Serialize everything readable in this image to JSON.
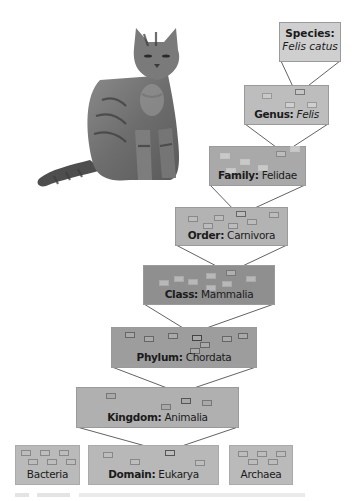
{
  "diagram": {
    "type": "taxonomic-hierarchy",
    "image": {
      "subject": "cat-photo",
      "description": "Grey tabby cat sitting"
    },
    "levels": [
      {
        "rank": "Species",
        "name": "Felis catus",
        "italic": true,
        "fill": "#cfcfcf"
      },
      {
        "rank": "Genus",
        "name": "Felis",
        "italic": true,
        "fill": "#bdbdbd"
      },
      {
        "rank": "Family",
        "name": "Felidae",
        "italic": false,
        "fill": "#a9a9a9"
      },
      {
        "rank": "Order",
        "name": "Carnivora",
        "italic": false,
        "fill": "#b3b3b3"
      },
      {
        "rank": "Class",
        "name": "Mammalia",
        "italic": false,
        "fill": "#8f8f8f"
      },
      {
        "rank": "Phylum",
        "name": "Chordata",
        "italic": false,
        "fill": "#9d9d9d"
      },
      {
        "rank": "Kingdom",
        "name": "Animalia",
        "italic": false,
        "fill": "#b0b0b0"
      },
      {
        "rank": "Domain",
        "name": "Eukarya",
        "italic": false,
        "fill": "#b8b8b8"
      }
    ],
    "sibling_domains": [
      {
        "name": "Bacteria",
        "fill": "#bababa"
      },
      {
        "name": "Archaea",
        "fill": "#bababa"
      }
    ],
    "labels": {
      "species_rank": "Species:",
      "species_name": "Felis catus",
      "genus_rank": "Genus:",
      "genus_name": "Felis",
      "family_rank": "Family:",
      "family_name": "Felidae",
      "order_rank": "Order:",
      "order_name": "Carnivora",
      "class_rank": "Class:",
      "class_name": "Mammalia",
      "phylum_rank": "Phylum:",
      "phylum_name": "Chordata",
      "kingdom_rank": "Kingdom:",
      "kingdom_name": "Animalia",
      "domain_rank": "Domain:",
      "domain_name": "Eukarya",
      "bacteria": "Bacteria",
      "archaea": "Archaea"
    }
  }
}
